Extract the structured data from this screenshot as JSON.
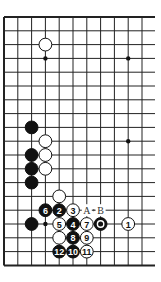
{
  "diagram": {
    "type": "go-board-diagram",
    "grid": {
      "origin_x": 4,
      "origin_y": 17,
      "spacing": 13.8,
      "cols_visible": 11,
      "rows": 19,
      "line_extend_right_to": 155,
      "edges": [
        "top",
        "left",
        "bottom"
      ],
      "line_color": "#222222"
    },
    "star_points": [
      {
        "col": 3,
        "row": 3
      },
      {
        "col": 9,
        "row": 3
      },
      {
        "col": 9,
        "row": 9
      },
      {
        "col": 3,
        "row": 15
      }
    ],
    "stones": [
      {
        "color": "white",
        "col": 3,
        "row": 2,
        "label": ""
      },
      {
        "color": "black",
        "col": 2,
        "row": 8,
        "label": ""
      },
      {
        "color": "white",
        "col": 3,
        "row": 9,
        "label": ""
      },
      {
        "color": "black",
        "col": 2,
        "row": 10,
        "label": ""
      },
      {
        "color": "white",
        "col": 3,
        "row": 10,
        "label": ""
      },
      {
        "color": "black",
        "col": 2,
        "row": 11,
        "label": ""
      },
      {
        "color": "white",
        "col": 3,
        "row": 11,
        "label": ""
      },
      {
        "color": "black",
        "col": 2,
        "row": 12,
        "label": ""
      },
      {
        "color": "white",
        "col": 4,
        "row": 13,
        "label": ""
      },
      {
        "color": "black",
        "col": 3,
        "row": 14,
        "label": "6"
      },
      {
        "color": "black",
        "col": 4,
        "row": 14,
        "label": "2"
      },
      {
        "color": "white",
        "col": 5,
        "row": 14,
        "label": "3"
      },
      {
        "color": "black",
        "col": 2,
        "row": 15,
        "label": ""
      },
      {
        "color": "white",
        "col": 4,
        "row": 15,
        "label": "5"
      },
      {
        "color": "black",
        "col": 5,
        "row": 15,
        "label": "4"
      },
      {
        "color": "white",
        "col": 6,
        "row": 15,
        "label": "7"
      },
      {
        "color": "black",
        "col": 7,
        "row": 15,
        "label": "",
        "marker": "circle"
      },
      {
        "color": "white",
        "col": 9,
        "row": 15,
        "label": "1"
      },
      {
        "color": "white",
        "col": 4,
        "row": 16,
        "label": ""
      },
      {
        "color": "black",
        "col": 5,
        "row": 16,
        "label": "8"
      },
      {
        "color": "white",
        "col": 6,
        "row": 16,
        "label": "9"
      },
      {
        "color": "black",
        "col": 4,
        "row": 17,
        "label": "12"
      },
      {
        "color": "black",
        "col": 5,
        "row": 17,
        "label": "10"
      },
      {
        "color": "white",
        "col": 6,
        "row": 17,
        "label": "11"
      }
    ],
    "point_labels": [
      {
        "col": 6,
        "row": 14,
        "text": "A"
      },
      {
        "col": 7,
        "row": 14,
        "text": "B"
      }
    ]
  }
}
